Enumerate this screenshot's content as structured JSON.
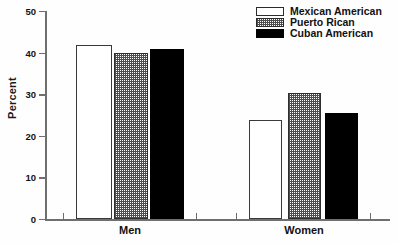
{
  "chart_data": {
    "type": "bar",
    "title": "",
    "xlabel": "",
    "ylabel": "Percent",
    "ylim": [
      0,
      50
    ],
    "yticks": [
      0,
      10,
      20,
      30,
      40,
      50
    ],
    "ytick_labels": [
      "0",
      "10",
      "20",
      "30",
      "40",
      "50"
    ],
    "grid": false,
    "legend_position": "top-right",
    "categories": [
      "Men",
      "Women"
    ],
    "series": [
      {
        "name": "Mexican American",
        "fill": "white",
        "color": "#ffffff",
        "values": [
          41.8,
          23.8
        ]
      },
      {
        "name": "Puerto Rican",
        "fill": "hatch",
        "color": "#4d4d4d",
        "values": [
          39.8,
          30.2
        ]
      },
      {
        "name": "Cuban American",
        "fill": "black",
        "color": "#000000",
        "values": [
          40.8,
          25.6
        ]
      }
    ]
  },
  "axis": {
    "y_label": "Percent",
    "tick_0": "0",
    "tick_10": "10",
    "tick_20": "20",
    "tick_30": "30",
    "tick_40": "40",
    "tick_50": "50"
  },
  "categories": {
    "men": "Men",
    "women": "Women"
  },
  "legend": {
    "item_0": "Mexican American",
    "item_1": "Puerto Rican",
    "item_2": "Cuban American"
  }
}
